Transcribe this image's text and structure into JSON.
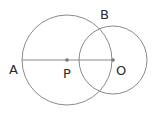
{
  "diagram": {
    "type": "geometry",
    "stroke_color": "#8a8a8a",
    "point_color": "#777777",
    "label_color": "#2a2a2a",
    "circles": [
      {
        "name": "large-circle",
        "center": "P",
        "cx": 67,
        "cy": 60,
        "r": 45
      },
      {
        "name": "small-circle",
        "center": "O",
        "cx": 113,
        "cy": 60,
        "r": 34
      }
    ],
    "segment": {
      "from": "A",
      "to": "O",
      "x1": 22,
      "y1": 60,
      "x2": 113,
      "y2": 60
    },
    "points": {
      "A": {
        "label": "A",
        "x": 22,
        "y": 60
      },
      "P": {
        "label": "P",
        "x": 67,
        "y": 60
      },
      "O": {
        "label": "O",
        "x": 113,
        "y": 60
      },
      "B": {
        "label": "B",
        "x": 102,
        "y": 27
      }
    }
  }
}
